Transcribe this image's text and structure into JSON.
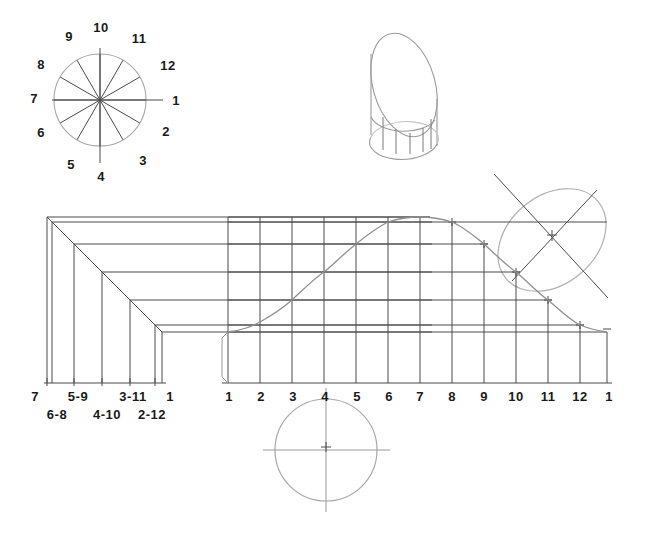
{
  "drawing": {
    "title": "Development of a truncated cylinder",
    "ink_color": "#3a3a3a",
    "light_color": "#9a9a9a",
    "text_color": "#1a1a1a"
  },
  "plan_circle": {
    "name": "twelve-division-plan-circle",
    "center": [
      100,
      100
    ],
    "radius": 46,
    "divisions": 12,
    "labels": [
      {
        "text": "1",
        "x": 176,
        "y": 100
      },
      {
        "text": "2",
        "x": 166,
        "y": 131
      },
      {
        "text": "3",
        "x": 143,
        "y": 160
      },
      {
        "text": "4",
        "x": 101,
        "y": 176
      },
      {
        "text": "5",
        "x": 71,
        "y": 164
      },
      {
        "text": "6",
        "x": 41,
        "y": 132
      },
      {
        "text": "7",
        "x": 34,
        "y": 98
      },
      {
        "text": "8",
        "x": 41,
        "y": 64
      },
      {
        "text": "9",
        "x": 69,
        "y": 36
      },
      {
        "text": "10",
        "x": 101,
        "y": 27
      },
      {
        "text": "11",
        "x": 139,
        "y": 38
      },
      {
        "text": "12",
        "x": 168,
        "y": 65
      }
    ]
  },
  "pictorial": {
    "name": "truncated-cylinder-pictorial",
    "description": "Isometric truncated cylinder with cut ellipse face and element lines"
  },
  "true_shape_ellipse": {
    "name": "true-shape-of-cut-ellipse",
    "center": [
      552,
      240
    ],
    "major_axis": 120,
    "minor_axis": 88,
    "rotation_deg": 40
  },
  "auxiliary_view": {
    "name": "left-auxiliary-elevation",
    "labels_top": [
      {
        "text": "7",
        "x": 35,
        "y": 396
      },
      {
        "text": "5-9",
        "x": 78,
        "y": 396
      },
      {
        "text": "3-11",
        "x": 133,
        "y": 396
      },
      {
        "text": "1",
        "x": 170,
        "y": 396
      }
    ],
    "labels_bottom": [
      {
        "text": "6-8",
        "x": 57,
        "y": 414
      },
      {
        "text": "4-10",
        "x": 107,
        "y": 414
      },
      {
        "text": "2-12",
        "x": 152,
        "y": 414
      }
    ]
  },
  "development": {
    "name": "stretch-out-development-pattern",
    "baseline_y": 383,
    "station_labels": [
      {
        "text": "1",
        "x": 229,
        "y": 396
      },
      {
        "text": "2",
        "x": 261,
        "y": 396
      },
      {
        "text": "3",
        "x": 293,
        "y": 396
      },
      {
        "text": "4",
        "x": 325,
        "y": 396
      },
      {
        "text": "5",
        "x": 357,
        "y": 396
      },
      {
        "text": "6",
        "x": 389,
        "y": 396
      },
      {
        "text": "7",
        "x": 420,
        "y": 396
      },
      {
        "text": "8",
        "x": 452,
        "y": 396
      },
      {
        "text": "9",
        "x": 484,
        "y": 396
      },
      {
        "text": "10",
        "x": 516,
        "y": 396
      },
      {
        "text": "11",
        "x": 548,
        "y": 396
      },
      {
        "text": "12",
        "x": 580,
        "y": 396
      },
      {
        "text": "1",
        "x": 609,
        "y": 396
      }
    ]
  },
  "bottom_circle": {
    "name": "end-view-circle",
    "center": [
      326,
      450
    ],
    "radius": 51
  }
}
